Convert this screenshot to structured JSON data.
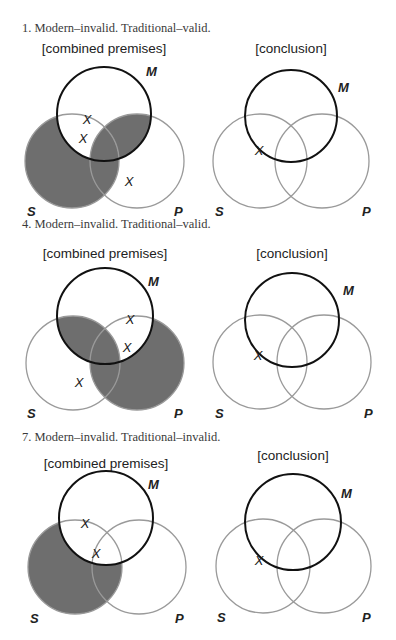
{
  "colors": {
    "background": "#ffffff",
    "shade": "#6e6e6e",
    "m_circle": "#111111",
    "sp_circle": "#9a9a9a",
    "text": "#222222"
  },
  "problems": [
    {
      "caption": "1. Modern–invalid. Traditional–valid.",
      "caption_pos": [
        22,
        32
      ],
      "premises": {
        "title": "[combined premises]",
        "title_pos": [
          104,
          53
        ],
        "circles": {
          "M": [
            104,
            114,
            47
          ],
          "S": [
            72,
            161,
            47
          ],
          "P": [
            137,
            161,
            47
          ]
        },
        "labels": {
          "M": [
            146,
            76
          ],
          "S": [
            27,
            216
          ],
          "P": [
            174,
            216
          ]
        },
        "shaded_regions": [
          "S-not-M",
          "S-and-M-and-P",
          "P-and-M-not-S"
        ],
        "x_marks": [
          [
            87,
            119
          ],
          [
            83,
            138
          ],
          [
            129,
            181
          ]
        ]
      },
      "conclusion": {
        "title": "[conclusion]",
        "title_pos": [
          291,
          53
        ],
        "circles": {
          "M": [
            291,
            116,
            46
          ],
          "S": [
            260,
            161,
            47
          ],
          "P": [
            322,
            161,
            47
          ]
        },
        "labels": {
          "M": [
            338,
            92
          ],
          "S": [
            215,
            216
          ],
          "P": [
            362,
            216
          ]
        },
        "shaded_regions": [],
        "x_marks": [
          [
            259,
            150
          ]
        ]
      }
    },
    {
      "caption": "4. Modern–invalid. Traditional–valid.",
      "caption_pos": [
        22,
        228
      ],
      "premises": {
        "title": "[combined premises]",
        "title_pos": [
          105,
          258
        ],
        "circles": {
          "M": [
            105,
            316,
            48
          ],
          "S": [
            73,
            363,
            47
          ],
          "P": [
            137,
            363,
            47
          ]
        },
        "labels": {
          "M": [
            148,
            286
          ],
          "S": [
            27,
            418
          ],
          "P": [
            174,
            418
          ]
        },
        "shaded_regions": [
          "S-and-M",
          "P-not-M"
        ],
        "x_marks": [
          [
            130,
            319
          ],
          [
            127,
            347
          ],
          [
            79,
            382
          ]
        ]
      },
      "conclusion": {
        "title": "[conclusion]",
        "title_pos": [
          292,
          258
        ],
        "circles": {
          "M": [
            292,
            320,
            47
          ],
          "S": [
            260,
            362,
            47
          ],
          "P": [
            324,
            362,
            47
          ]
        },
        "labels": {
          "M": [
            343,
            295
          ],
          "S": [
            215,
            418
          ],
          "P": [
            364,
            418
          ]
        },
        "shaded_regions": [],
        "x_marks": [
          [
            258,
            355
          ]
        ]
      }
    },
    {
      "caption": "7. Modern–invalid. Traditional–invalid.",
      "caption_pos": [
        22,
        441
      ],
      "premises": {
        "title": "[combined premises]",
        "title_pos": [
          106,
          468
        ],
        "circles": {
          "M": [
            106,
            518,
            47
          ],
          "S": [
            75,
            567,
            47
          ],
          "P": [
            139,
            567,
            47
          ]
        },
        "labels": {
          "M": [
            148,
            489
          ],
          "S": [
            30,
            623
          ],
          "P": [
            175,
            623
          ]
        },
        "shaded_regions": [
          "S-not-M"
        ],
        "x_marks": [
          [
            85,
            523
          ],
          [
            96,
            553
          ]
        ]
      },
      "conclusion": {
        "title": "[conclusion]",
        "title_pos": [
          293,
          460
        ],
        "circles": {
          "M": [
            293,
            522,
            48
          ],
          "S": [
            263,
            566,
            47
          ],
          "P": [
            324,
            566,
            47
          ]
        },
        "labels": {
          "M": [
            341,
            498
          ],
          "S": [
            217,
            622
          ],
          "P": [
            362,
            622
          ]
        },
        "shaded_regions": [],
        "x_marks": [
          [
            259,
            560
          ]
        ]
      }
    }
  ],
  "glyphs": {
    "x_mark": "X",
    "M": "M",
    "S": "S",
    "P": "P"
  }
}
